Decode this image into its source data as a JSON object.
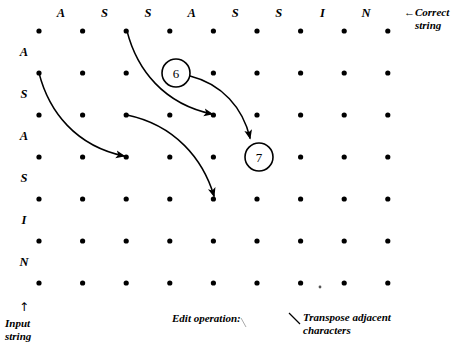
{
  "figure": {
    "kind": "edit-distance-lattice",
    "correct_string_label_line1": "←Correct",
    "correct_string_label_line2": "string",
    "input_string_arrow": "↑",
    "input_string_label_line1": "Input",
    "input_string_label_line2": "string",
    "edit_operation_label": "Edit operation:",
    "transpose_label_line1": "Transpose adjacent",
    "transpose_label_line2": "characters",
    "ink_color": "#000000",
    "background_color": "#ffffff"
  },
  "columns": {
    "header_label": "Correct string",
    "letters": [
      "A",
      "S",
      "S",
      "A",
      "S",
      "S",
      "I",
      "N"
    ]
  },
  "rows": {
    "header_label": "Input string",
    "letters": [
      "A",
      "S",
      "A",
      "S",
      "I",
      "N"
    ]
  },
  "grid": {
    "dot_columns": 9,
    "dot_rows": 7,
    "x0": 39,
    "y0": 31,
    "dx": 43.6,
    "dy": 42,
    "dot_radius": 2.6
  },
  "nodes": [
    {
      "id": "node-6",
      "label": "6",
      "cx": 176,
      "cy": 73,
      "r": 14
    },
    {
      "id": "node-7",
      "label": "7",
      "cx": 259,
      "cy": 157,
      "r": 14
    }
  ],
  "edges": [
    {
      "id": "edge-insert-a",
      "name": "arrow-row1-to-row3",
      "from": [
        39,
        73
      ],
      "to": [
        127,
        157
      ],
      "path": "M 39 73 C 49 112, 76 146, 124 156"
    },
    {
      "id": "edge-substitute-top",
      "name": "arrow-top-to-node6-row",
      "from": [
        127,
        31
      ],
      "to": [
        215,
        115
      ],
      "path": "M 127 31 C 137 70, 164 104, 212 114"
    },
    {
      "id": "edge-node6-to-node7",
      "name": "arrow-node6-to-node7",
      "from": [
        190,
        76
      ],
      "to": [
        252,
        141
      ],
      "path": "M 190 76 C 222 84, 243 108, 250 138"
    },
    {
      "id": "edge-transpose-down",
      "name": "arrow-row3-to-row5",
      "from": [
        127,
        115
      ],
      "to": [
        215,
        199
      ],
      "path": "M 127 115 C 175 125, 203 159, 214 196"
    }
  ],
  "marks": {
    "transpose_pointer_path": "M 289 313 L 300 324",
    "edit_operation_tick_path": "M 241 317 L 247 327"
  }
}
